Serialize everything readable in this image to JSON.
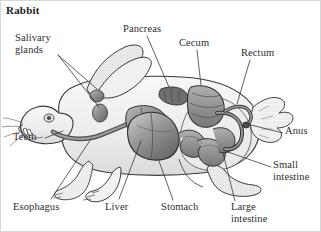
{
  "figure": {
    "title": "Rabbit",
    "style": "grayscale-pen-and-ink-stipple-illustration",
    "background_color": "#ffffff",
    "text_color": "#2d2d2d",
    "border_color": "#d8d8d8"
  },
  "labels": [
    {
      "id": "salivary-glands",
      "text": "Salivary\nglands",
      "x": 14,
      "y": 31,
      "leader": [
        [
          57,
          54
        ],
        [
          96,
          88
        ]
      ]
    },
    {
      "id": "pancreas",
      "text": "Pancreas",
      "x": 122,
      "y": 22,
      "leader": [
        [
          146,
          35
        ],
        [
          162,
          86
        ]
      ]
    },
    {
      "id": "cecum",
      "text": "Cecum",
      "x": 178,
      "y": 36,
      "leader": [
        [
          196,
          49
        ],
        [
          196,
          82
        ]
      ]
    },
    {
      "id": "rectum",
      "text": "Rectum",
      "x": 240,
      "y": 46,
      "leader": [
        [
          249,
          59
        ],
        [
          219,
          99
        ]
      ]
    },
    {
      "id": "anus",
      "text": "Anus",
      "x": 284,
      "y": 128,
      "leader": [
        [
          282,
          132
        ],
        [
          245,
          121
        ]
      ]
    },
    {
      "id": "small-intestine",
      "text": "Small\nintestine",
      "x": 272,
      "y": 160,
      "leader": [
        [
          270,
          165
        ],
        [
          232,
          140
        ]
      ]
    },
    {
      "id": "large-intestine",
      "text": "Large\nintestine",
      "x": 230,
      "y": 204,
      "leader": [
        [
          234,
          202
        ],
        [
          211,
          160
        ]
      ]
    },
    {
      "id": "stomach",
      "text": "Stomach",
      "x": 160,
      "y": 204,
      "leader": [
        [
          172,
          201
        ],
        [
          158,
          152
        ]
      ]
    },
    {
      "id": "liver",
      "text": "Liver",
      "x": 104,
      "y": 204,
      "leader": [
        [
          116,
          201
        ],
        [
          137,
          148
        ]
      ]
    },
    {
      "id": "esophagus",
      "text": "Esophagus",
      "x": 12,
      "y": 204,
      "leader": [
        [
          48,
          201
        ],
        [
          84,
          144
        ]
      ]
    },
    {
      "id": "teeth",
      "text": "Teeth",
      "x": 12,
      "y": 134,
      "leader": [
        [
          42,
          138
        ],
        [
          66,
          124
        ]
      ]
    }
  ]
}
